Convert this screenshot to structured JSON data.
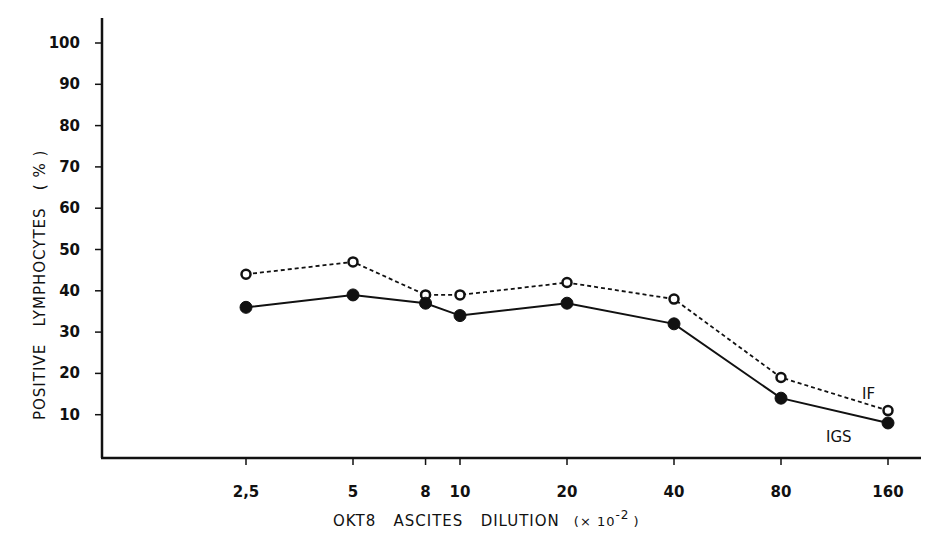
{
  "chart_data": {
    "type": "line",
    "title": "",
    "xlabel": "OKT8   ASCITES   DILUTION   (× 10⁻² )",
    "ylabel": "POSITIVE   LYMPHOCYTES   ( % )",
    "x_scale": "log",
    "x": [
      2.5,
      5,
      8,
      10,
      20,
      40,
      80,
      160
    ],
    "x_tick_labels": [
      "2,5",
      "5",
      "8",
      "10",
      "20",
      "40",
      "80",
      "160"
    ],
    "y_ticks": [
      10,
      20,
      30,
      40,
      50,
      60,
      70,
      80,
      90,
      100
    ],
    "ylim": [
      0,
      100
    ],
    "grid": false,
    "legend_position": "inline labels at right end of lines",
    "series": [
      {
        "name": "IF",
        "style": "dashed line, open circle markers",
        "values": [
          44,
          47,
          39,
          39,
          42,
          38,
          19,
          11
        ]
      },
      {
        "name": "IGS",
        "style": "solid line, filled circle markers",
        "values": [
          36,
          39,
          37,
          34,
          37,
          32,
          14,
          8
        ]
      }
    ]
  },
  "labels": {
    "y_title": "POSITIVE   LYMPHOCYTES   ( % )",
    "x_title_main": "OKT8   ASCITES   DILUTION",
    "x_title_unit": "(× 10",
    "x_title_exp": "-2",
    "x_title_close": ")",
    "series_if": "IF",
    "series_igs": "IGS"
  }
}
